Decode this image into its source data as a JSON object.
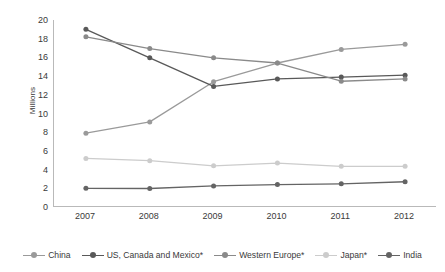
{
  "chart_data": {
    "type": "line",
    "title": "",
    "subtitle": "",
    "xlabel": "",
    "ylabel": "Millions",
    "categories": [
      "2007",
      "2008",
      "2009",
      "2010",
      "2011",
      "2012"
    ],
    "x": [
      2007,
      2008,
      2009,
      2010,
      2011,
      2012
    ],
    "ylim": [
      0,
      20
    ],
    "ytick_step": 2,
    "yticks": [
      "20",
      "18",
      "16",
      "14",
      "12",
      "10",
      "8",
      "6",
      "4",
      "2",
      "0"
    ],
    "grid": false,
    "legend_position": "bottom",
    "series": [
      {
        "name": "China",
        "color": "#9a9a9a",
        "values": [
          7.9,
          9.1,
          13.4,
          15.4,
          16.85,
          17.4
        ]
      },
      {
        "name": "US, Canada and Mexico*",
        "color": "#595959",
        "values": [
          19.0,
          15.95,
          12.9,
          13.7,
          13.9,
          14.1
        ]
      },
      {
        "name": "Western Europe*",
        "color": "#8a8a8a",
        "values": [
          18.2,
          16.95,
          15.95,
          15.4,
          13.45,
          13.7
        ]
      },
      {
        "name": "Japan*",
        "color": "#cccccc",
        "values": [
          5.2,
          4.95,
          4.4,
          4.7,
          4.35,
          4.35
        ]
      },
      {
        "name": "India",
        "color": "#646464",
        "values": [
          2.0,
          1.98,
          2.25,
          2.4,
          2.48,
          2.7
        ]
      }
    ]
  },
  "axis": {
    "line_color": "#b9b9b9"
  }
}
